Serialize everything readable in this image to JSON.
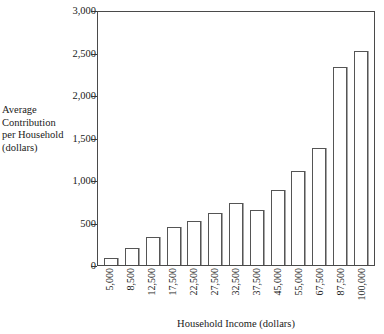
{
  "chart_data": {
    "type": "bar",
    "title": "",
    "subtitle": "",
    "xlabel": "Household Income (dollars)",
    "ylabel": "Average Contribution per Household (dollars)",
    "ylabel_lines": "Average\nContribution\nper Household\n(dollars)",
    "categories": [
      "5,000",
      "8,500",
      "12,500",
      "17,500",
      "22,500",
      "27,500",
      "32,500",
      "37,500",
      "45,000",
      "55,000",
      "67,500",
      "87,500",
      "100,000"
    ],
    "values": [
      85,
      195,
      330,
      450,
      520,
      610,
      730,
      645,
      885,
      1105,
      1375,
      2330,
      2515
    ],
    "ylim": [
      0,
      3000
    ],
    "yticks": [
      0,
      500,
      1000,
      1500,
      2000,
      2500,
      3000
    ],
    "ytick_labels": [
      "0",
      "500",
      "1,000",
      "1,500",
      "2,000",
      "2,500",
      "3,000"
    ],
    "grid": false,
    "legend": false,
    "legend_position": "none",
    "bar_fill_color": "#ffffff",
    "bar_edge_color": "#555555",
    "axis_color": "#4a4a4a",
    "background_color": "#ffffff",
    "text_color": "#1a1a1a"
  }
}
